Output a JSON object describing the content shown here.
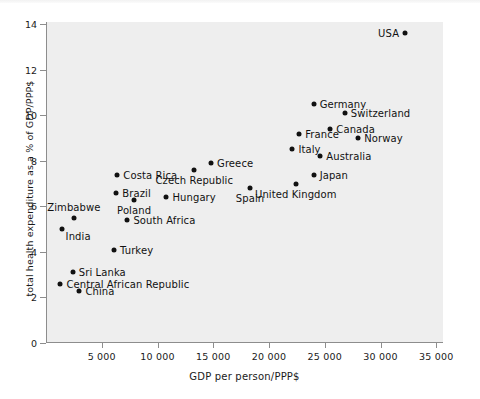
{
  "chart_data": {
    "type": "scatter",
    "title": "",
    "xlabel": "GDP per person/PPP$",
    "ylabel": "total health expenditure as a % of GDP/PPP$",
    "xlim": [
      0,
      35600
    ],
    "ylim": [
      0,
      14.1
    ],
    "grid": false,
    "legend": "none",
    "xticks": [
      5000,
      10000,
      15000,
      20000,
      25000,
      30000,
      35000
    ],
    "xticklabels": [
      "5 000",
      "10 000",
      "15 000",
      "20 000",
      "25 000",
      "30 000",
      "35 000"
    ],
    "yticks": [
      0,
      2,
      4,
      6,
      8,
      10,
      12,
      14
    ],
    "yticklabels": [
      "0",
      "2",
      "4",
      "6",
      "8",
      "10",
      "12",
      "14"
    ],
    "marker_color": "#111111",
    "panel_color": "#eeeeee",
    "points": [
      {
        "label": "USA",
        "x": 32200,
        "y": 13.6,
        "side": "left"
      },
      {
        "label": "Germany",
        "x": 24000,
        "y": 10.5,
        "side": "right"
      },
      {
        "label": "Switzerland",
        "x": 26800,
        "y": 10.1,
        "side": "right"
      },
      {
        "label": "Canada",
        "x": 25500,
        "y": 9.4,
        "side": "right"
      },
      {
        "label": "France",
        "x": 22700,
        "y": 9.2,
        "side": "right"
      },
      {
        "label": "Norway",
        "x": 28000,
        "y": 9.0,
        "side": "right"
      },
      {
        "label": "Italy",
        "x": 22100,
        "y": 8.5,
        "side": "right"
      },
      {
        "label": "Australia",
        "x": 24600,
        "y": 8.2,
        "side": "right"
      },
      {
        "label": "Greece",
        "x": 14800,
        "y": 7.9,
        "side": "right"
      },
      {
        "label": "Czech Republic",
        "x": 13300,
        "y": 7.6,
        "side": "below"
      },
      {
        "label": "Costa Rica",
        "x": 6400,
        "y": 7.4,
        "side": "right"
      },
      {
        "label": "Japan",
        "x": 24000,
        "y": 7.4,
        "side": "right"
      },
      {
        "label": "United Kingdom",
        "x": 22400,
        "y": 7.0,
        "side": "below"
      },
      {
        "label": "Spain",
        "x": 18300,
        "y": 6.8,
        "side": "below"
      },
      {
        "label": "Brazil",
        "x": 6300,
        "y": 6.6,
        "side": "right"
      },
      {
        "label": "Hungary",
        "x": 10800,
        "y": 6.4,
        "side": "right"
      },
      {
        "label": "Poland",
        "x": 7900,
        "y": 6.3,
        "side": "below"
      },
      {
        "label": "Zimbabwe",
        "x": 2500,
        "y": 5.5,
        "side": "above"
      },
      {
        "label": "South Africa",
        "x": 7300,
        "y": 5.4,
        "side": "right"
      },
      {
        "label": "India",
        "x": 1400,
        "y": 5.0,
        "side": "belowright"
      },
      {
        "label": "Turkey",
        "x": 6100,
        "y": 4.1,
        "side": "right"
      },
      {
        "label": "Sri Lanka",
        "x": 2400,
        "y": 3.1,
        "side": "right"
      },
      {
        "label": "Central African Republic",
        "x": 1300,
        "y": 2.6,
        "side": "right"
      },
      {
        "label": "China",
        "x": 3000,
        "y": 2.3,
        "side": "right"
      }
    ]
  }
}
